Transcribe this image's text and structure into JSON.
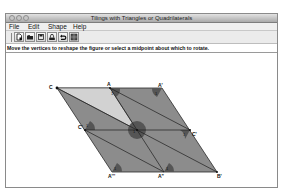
{
  "window": {
    "title": "Tilings with Triangles or Quadrilaterals",
    "traffic_lights": [
      "close",
      "minimize",
      "zoom"
    ]
  },
  "menubar": {
    "items": [
      {
        "label": "File"
      },
      {
        "label": "Edit"
      },
      {
        "label": "Shape"
      },
      {
        "label": "Help"
      }
    ]
  },
  "toolbar": {
    "buttons": [
      {
        "icon": "new-document-icon"
      },
      {
        "icon": "open-folder-icon"
      },
      {
        "icon": "save-icon"
      },
      {
        "icon": "print-icon"
      },
      {
        "icon": "undo-icon"
      },
      {
        "icon": "tile-grid-icon"
      }
    ]
  },
  "instructions": "Move the vertices to reshape the figure or select a midpoint about which to rotate.",
  "figure": {
    "colors": {
      "tile_fill": "#8c8c8c",
      "highlight_tile_fill": "#d2d2d2",
      "angle_marker": "#555555",
      "edge": "#2a2a2a"
    },
    "vertex_labels": {
      "C": "C",
      "A": "A",
      "A_prime": "A'",
      "C_prime": "C'",
      "C_left": "C'",
      "B": "B'",
      "A_double": "A\"",
      "A_triple": "A'''"
    },
    "angle_label": "1"
  }
}
